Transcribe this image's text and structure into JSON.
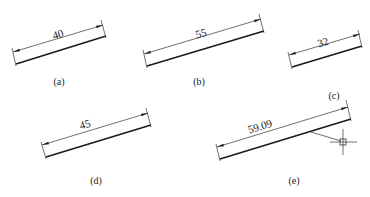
{
  "figures": [
    {
      "id": "a",
      "caption": "(a)",
      "dimension": "40"
    },
    {
      "id": "b",
      "caption": "(b)",
      "dimension": "55"
    },
    {
      "id": "c",
      "caption": "(c)",
      "dimension": "32"
    },
    {
      "id": "d",
      "caption": "(d)",
      "dimension": "45"
    },
    {
      "id": "e",
      "caption": "(e)",
      "dimension": "59.09"
    }
  ],
  "cursor": {
    "icon": "crosshair-pickbox-icon"
  },
  "colors": {
    "line": "#1a1a1a",
    "background": "#ffffff"
  }
}
